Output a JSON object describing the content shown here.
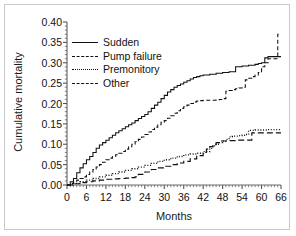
{
  "chart_data": {
    "type": "line",
    "title": "",
    "xlabel": "Months",
    "ylabel": "Cumulative mortality",
    "xlim": [
      0,
      66
    ],
    "ylim": [
      0.0,
      0.4
    ],
    "xticks": [
      "0",
      "6",
      "12",
      "18",
      "24",
      "30",
      "36",
      "42",
      "48",
      "54",
      "60",
      "66"
    ],
    "yticks": [
      "0.00",
      "0.05",
      "0.10",
      "0.15",
      "0.20",
      "0.25",
      "0.30",
      "0.35",
      "0.40"
    ],
    "grid": false,
    "legend_position": "upper-left",
    "series": [
      {
        "name": "Sudden",
        "style": "solid",
        "color": "#111111",
        "points": [
          [
            0,
            0.0
          ],
          [
            1,
            0.008
          ],
          [
            2,
            0.016
          ],
          [
            3,
            0.03
          ],
          [
            4,
            0.042
          ],
          [
            5,
            0.052
          ],
          [
            6,
            0.062
          ],
          [
            7,
            0.07
          ],
          [
            8,
            0.08
          ],
          [
            9,
            0.09
          ],
          [
            10,
            0.098
          ],
          [
            11,
            0.104
          ],
          [
            12,
            0.11
          ],
          [
            13,
            0.116
          ],
          [
            14,
            0.122
          ],
          [
            15,
            0.128
          ],
          [
            16,
            0.133
          ],
          [
            17,
            0.138
          ],
          [
            18,
            0.143
          ],
          [
            19,
            0.148
          ],
          [
            20,
            0.152
          ],
          [
            21,
            0.158
          ],
          [
            22,
            0.163
          ],
          [
            23,
            0.168
          ],
          [
            24,
            0.173
          ],
          [
            25,
            0.18
          ],
          [
            26,
            0.188
          ],
          [
            27,
            0.196
          ],
          [
            28,
            0.203
          ],
          [
            29,
            0.212
          ],
          [
            30,
            0.22
          ],
          [
            31,
            0.228
          ],
          [
            32,
            0.234
          ],
          [
            33,
            0.24
          ],
          [
            34,
            0.244
          ],
          [
            35,
            0.248
          ],
          [
            36,
            0.252
          ],
          [
            37,
            0.256
          ],
          [
            38,
            0.26
          ],
          [
            39,
            0.264
          ],
          [
            40,
            0.266
          ],
          [
            41,
            0.268
          ],
          [
            42,
            0.27
          ],
          [
            44,
            0.272
          ],
          [
            46,
            0.274
          ],
          [
            48,
            0.276
          ],
          [
            50,
            0.278
          ],
          [
            52,
            0.29
          ],
          [
            54,
            0.292
          ],
          [
            56,
            0.294
          ],
          [
            58,
            0.296
          ],
          [
            59,
            0.298
          ],
          [
            60,
            0.3
          ],
          [
            61,
            0.312
          ],
          [
            62,
            0.315
          ],
          [
            64,
            0.315
          ],
          [
            66,
            0.315
          ]
        ]
      },
      {
        "name": "Pump failure",
        "style": "dashed",
        "color": "#111111",
        "points": [
          [
            0,
            0.0
          ],
          [
            1,
            0.004
          ],
          [
            2,
            0.008
          ],
          [
            3,
            0.012
          ],
          [
            4,
            0.016
          ],
          [
            5,
            0.02
          ],
          [
            6,
            0.026
          ],
          [
            7,
            0.032
          ],
          [
            8,
            0.038
          ],
          [
            9,
            0.044
          ],
          [
            10,
            0.05
          ],
          [
            11,
            0.056
          ],
          [
            12,
            0.062
          ],
          [
            13,
            0.066
          ],
          [
            14,
            0.07
          ],
          [
            15,
            0.074
          ],
          [
            16,
            0.078
          ],
          [
            17,
            0.082
          ],
          [
            18,
            0.088
          ],
          [
            19,
            0.094
          ],
          [
            20,
            0.1
          ],
          [
            21,
            0.106
          ],
          [
            22,
            0.112
          ],
          [
            23,
            0.118
          ],
          [
            24,
            0.124
          ],
          [
            25,
            0.13
          ],
          [
            26,
            0.136
          ],
          [
            27,
            0.142
          ],
          [
            28,
            0.148
          ],
          [
            29,
            0.154
          ],
          [
            30,
            0.158
          ],
          [
            31,
            0.164
          ],
          [
            32,
            0.17
          ],
          [
            33,
            0.176
          ],
          [
            34,
            0.182
          ],
          [
            35,
            0.188
          ],
          [
            36,
            0.192
          ],
          [
            37,
            0.196
          ],
          [
            38,
            0.2
          ],
          [
            39,
            0.204
          ],
          [
            40,
            0.206
          ],
          [
            41,
            0.207
          ],
          [
            42,
            0.208
          ],
          [
            43,
            0.208
          ],
          [
            44,
            0.208
          ],
          [
            45,
            0.208
          ],
          [
            46,
            0.209
          ],
          [
            47,
            0.21
          ],
          [
            48,
            0.212
          ],
          [
            49,
            0.23
          ],
          [
            50,
            0.232
          ],
          [
            51,
            0.234
          ],
          [
            52,
            0.236
          ],
          [
            53,
            0.238
          ],
          [
            54,
            0.24
          ],
          [
            55,
            0.258
          ],
          [
            56,
            0.262
          ],
          [
            57,
            0.266
          ],
          [
            58,
            0.27
          ],
          [
            59,
            0.276
          ],
          [
            60,
            0.29
          ],
          [
            61,
            0.3
          ],
          [
            62,
            0.31
          ],
          [
            63,
            0.31
          ],
          [
            64,
            0.31
          ],
          [
            65,
            0.37
          ],
          [
            66,
            0.37
          ]
        ]
      },
      {
        "name": "Premonitory",
        "style": "dotted",
        "color": "#111111",
        "points": [
          [
            0,
            0.0
          ],
          [
            2,
            0.004
          ],
          [
            4,
            0.008
          ],
          [
            6,
            0.012
          ],
          [
            8,
            0.016
          ],
          [
            10,
            0.02
          ],
          [
            12,
            0.024
          ],
          [
            14,
            0.028
          ],
          [
            16,
            0.032
          ],
          [
            18,
            0.036
          ],
          [
            20,
            0.04
          ],
          [
            22,
            0.044
          ],
          [
            24,
            0.048
          ],
          [
            26,
            0.053
          ],
          [
            28,
            0.058
          ],
          [
            30,
            0.062
          ],
          [
            32,
            0.066
          ],
          [
            34,
            0.07
          ],
          [
            36,
            0.074
          ],
          [
            38,
            0.076
          ],
          [
            40,
            0.078
          ],
          [
            42,
            0.082
          ],
          [
            44,
            0.09
          ],
          [
            45,
            0.096
          ],
          [
            46,
            0.1
          ],
          [
            47,
            0.104
          ],
          [
            48,
            0.108
          ],
          [
            49,
            0.112
          ],
          [
            50,
            0.118
          ],
          [
            51,
            0.12
          ],
          [
            52,
            0.12
          ],
          [
            53,
            0.121
          ],
          [
            54,
            0.122
          ],
          [
            55,
            0.124
          ],
          [
            56,
            0.134
          ],
          [
            58,
            0.135
          ],
          [
            60,
            0.135
          ],
          [
            62,
            0.136
          ],
          [
            64,
            0.136
          ],
          [
            66,
            0.136
          ]
        ]
      },
      {
        "name": "Other",
        "style": "longdash",
        "color": "#111111",
        "points": [
          [
            0,
            0.0
          ],
          [
            2,
            0.003
          ],
          [
            4,
            0.006
          ],
          [
            6,
            0.008
          ],
          [
            8,
            0.01
          ],
          [
            10,
            0.012
          ],
          [
            12,
            0.014
          ],
          [
            14,
            0.015
          ],
          [
            16,
            0.016
          ],
          [
            18,
            0.017
          ],
          [
            20,
            0.018
          ],
          [
            21,
            0.02
          ],
          [
            22,
            0.026
          ],
          [
            24,
            0.032
          ],
          [
            26,
            0.038
          ],
          [
            28,
            0.042
          ],
          [
            30,
            0.046
          ],
          [
            32,
            0.05
          ],
          [
            34,
            0.054
          ],
          [
            36,
            0.058
          ],
          [
            38,
            0.064
          ],
          [
            40,
            0.072
          ],
          [
            42,
            0.08
          ],
          [
            43,
            0.088
          ],
          [
            44,
            0.094
          ],
          [
            45,
            0.1
          ],
          [
            46,
            0.104
          ],
          [
            47,
            0.108
          ],
          [
            48,
            0.108
          ],
          [
            50,
            0.109
          ],
          [
            52,
            0.11
          ],
          [
            54,
            0.11
          ],
          [
            56,
            0.11
          ],
          [
            57,
            0.128
          ],
          [
            58,
            0.128
          ],
          [
            60,
            0.128
          ],
          [
            62,
            0.128
          ],
          [
            64,
            0.128
          ],
          [
            66,
            0.128
          ]
        ]
      }
    ]
  },
  "legend": {
    "items": [
      {
        "label": "Sudden",
        "style": "solid"
      },
      {
        "label": "Pump failure",
        "style": "dashed"
      },
      {
        "label": "Premonitory",
        "style": "dotted"
      },
      {
        "label": "Other",
        "style": "longdash"
      }
    ]
  }
}
